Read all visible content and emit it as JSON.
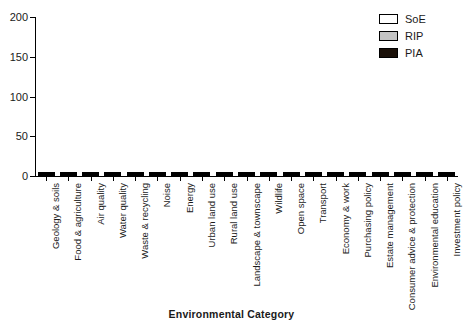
{
  "chart_data": {
    "type": "bar",
    "subtype": "stacked-bar",
    "title": "",
    "xlabel": "Environmental Category",
    "ylabel": "",
    "ylim": [
      0,
      200
    ],
    "yticks": [
      0,
      50,
      100,
      150,
      200
    ],
    "grid": false,
    "legend_position": "top-right",
    "categories": [
      "Geology & soils",
      "Food & agriculture",
      "Air quality",
      "Water quality",
      "Waste & recycling",
      "Noise",
      "Energy",
      "Urban land use",
      "Rural land use",
      "Landscape & townscape",
      "Wildlife",
      "Open space",
      "Transport",
      "Economy & work",
      "Purchasing policy",
      "Estate management",
      "Consumer advice & protection",
      "Environmental education",
      "Investment policy"
    ],
    "series": [
      {
        "name": "SoE",
        "color": "#ffffff",
        "values": [
          14,
          17,
          43,
          43,
          45,
          25,
          40,
          30,
          28,
          28,
          30,
          30,
          27,
          8,
          8,
          16,
          5,
          25,
          2
        ]
      },
      {
        "name": "RIP",
        "color": "#c4c4c4",
        "values": [
          10,
          8,
          47,
          41,
          65,
          33,
          60,
          42,
          32,
          45,
          55,
          50,
          73,
          34,
          67,
          50,
          25,
          75,
          16
        ]
      },
      {
        "name": "PIA",
        "color": "#1a1008",
        "values": [
          16,
          24,
          50,
          46,
          65,
          60,
          61,
          58,
          40,
          61,
          56,
          55,
          60,
          13,
          56,
          24,
          24,
          48,
          15
        ]
      }
    ],
    "totals": [
      40,
      49,
      140,
      130,
      175,
      118,
      161,
      130,
      100,
      134,
      141,
      135,
      160,
      55,
      131,
      90,
      54,
      148,
      33
    ]
  },
  "legend": {
    "entries": [
      {
        "label": "SoE",
        "swatch": "white-square-swatch"
      },
      {
        "label": "RIP",
        "swatch": "grey-square-swatch"
      },
      {
        "label": "PIA",
        "swatch": "black-square-swatch"
      }
    ]
  },
  "axes": {
    "y_tick_labels": [
      "200",
      "150",
      "100",
      "50",
      "0"
    ],
    "x_axis_title": "Environmental Category"
  }
}
